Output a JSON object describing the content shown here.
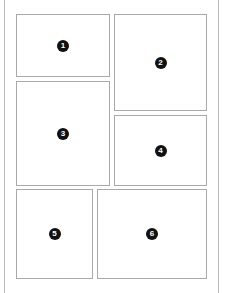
{
  "layout": {
    "title": "",
    "panels": [
      {
        "number": "1",
        "x": 16,
        "y": 14,
        "w": 94,
        "h": 63
      },
      {
        "number": "2",
        "x": 114,
        "y": 14,
        "w": 93,
        "h": 97
      },
      {
        "number": "3",
        "x": 16,
        "y": 81,
        "w": 94,
        "h": 105
      },
      {
        "number": "4",
        "x": 114,
        "y": 115,
        "w": 93,
        "h": 71
      },
      {
        "number": "5",
        "x": 16,
        "y": 189,
        "w": 77,
        "h": 90
      },
      {
        "number": "6",
        "x": 97,
        "y": 189,
        "w": 110,
        "h": 90
      }
    ]
  },
  "colors": {
    "border": "#a9a9a9",
    "badge": "#111111",
    "background": "#ffffff"
  }
}
